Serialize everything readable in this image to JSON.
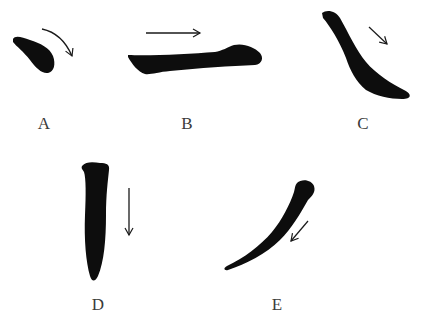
{
  "diagram": {
    "ink_color": "#0d0d0d",
    "arrow_color": "#1a1a1a",
    "strokes": [
      {
        "id": "A",
        "label": "A",
        "type": "dot",
        "arrow_direction": "curved-down-right"
      },
      {
        "id": "B",
        "label": "B",
        "type": "horizontal",
        "arrow_direction": "right"
      },
      {
        "id": "C",
        "label": "C",
        "type": "right-falling",
        "arrow_direction": "down-right"
      },
      {
        "id": "D",
        "label": "D",
        "type": "vertical",
        "arrow_direction": "down"
      },
      {
        "id": "E",
        "label": "E",
        "type": "left-falling",
        "arrow_direction": "down-left"
      }
    ]
  }
}
